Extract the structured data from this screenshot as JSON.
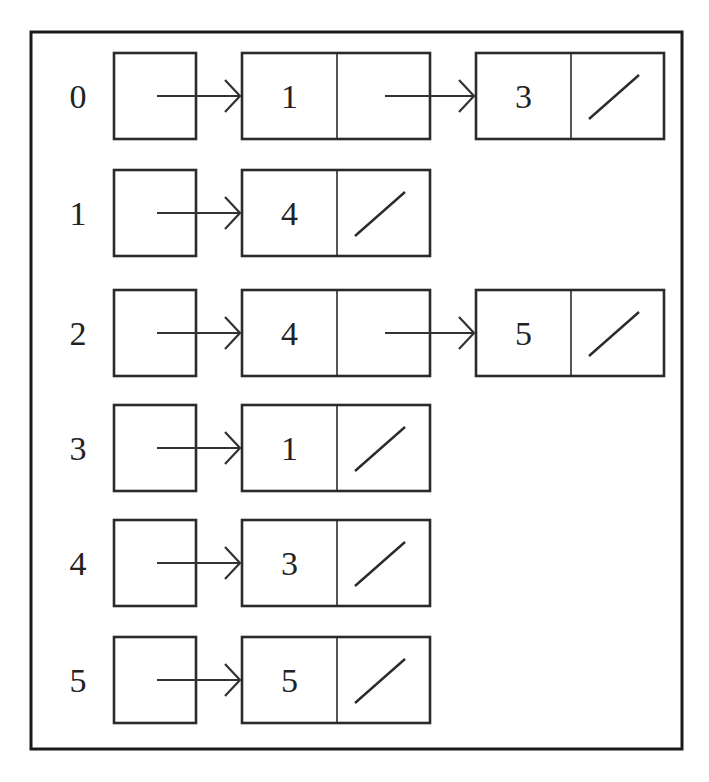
{
  "diagram": {
    "title": "",
    "type": "adjacency-list",
    "frame": {
      "x": 31,
      "y": 32,
      "w": 651,
      "h": 717
    },
    "rows": [
      {
        "index": "0",
        "nodes": [
          {
            "value": "1",
            "next": "pointer"
          },
          {
            "value": "3",
            "next": "null"
          }
        ]
      },
      {
        "index": "1",
        "nodes": [
          {
            "value": "4",
            "next": "null"
          }
        ]
      },
      {
        "index": "2",
        "nodes": [
          {
            "value": "4",
            "next": "pointer"
          },
          {
            "value": "5",
            "next": "null"
          }
        ]
      },
      {
        "index": "3",
        "nodes": [
          {
            "value": "1",
            "next": "null"
          }
        ]
      },
      {
        "index": "4",
        "nodes": [
          {
            "value": "3",
            "next": "null"
          }
        ]
      },
      {
        "index": "5",
        "nodes": [
          {
            "value": "5",
            "next": "null"
          }
        ]
      }
    ]
  }
}
